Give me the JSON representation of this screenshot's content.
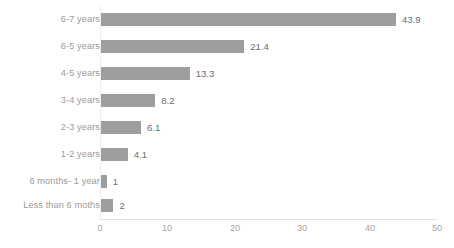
{
  "chart_data": {
    "type": "bar",
    "orientation": "horizontal",
    "title": "",
    "xlabel": "",
    "ylabel": "",
    "categories": [
      "6-7 years",
      "6-5 years",
      "4-5 years",
      "3-4 years",
      "2-3 years",
      "1-2 years",
      "6 months- 1 year",
      "Less than 6 moths"
    ],
    "values": [
      43.9,
      21.4,
      13.3,
      8.2,
      6.1,
      4.1,
      1,
      2
    ],
    "value_labels": [
      "43.9",
      "21.4",
      "13.3",
      "8.2",
      "6.1",
      "4.1",
      "1",
      "2"
    ],
    "xticks": [
      0,
      10,
      20,
      30,
      40,
      50
    ],
    "xtick_labels": [
      "0",
      "10",
      "20",
      "30",
      "40",
      "50"
    ],
    "xlim": [
      0,
      50
    ],
    "grid": false,
    "legend": false,
    "bar_color": "#9e9e9e",
    "label_color": "#9a9a9a",
    "value_color": "#6f6f6f",
    "tick_color": "#a6a6a6",
    "axis_color": "#e4e4e4",
    "background": "#ffffff"
  }
}
